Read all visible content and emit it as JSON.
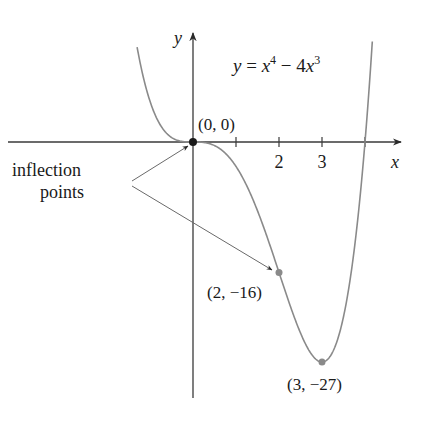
{
  "chart_data": {
    "type": "line",
    "equation": {
      "lhs": "y",
      "eq": " = ",
      "t1": "x",
      "e1": "4",
      "minus": " − 4",
      "t2": "x",
      "e2": "3"
    },
    "xlabel": "x",
    "ylabel": "y",
    "xticks": [
      1,
      2,
      3,
      4
    ],
    "xtick_labels": [
      {
        "x": 2,
        "label": "2"
      },
      {
        "x": 3,
        "label": "3"
      }
    ],
    "xlim": [
      -1.3,
      4.17
    ],
    "ylim": [
      -27,
      12
    ],
    "function": "x^4 - 4x^3",
    "points": [
      {
        "x": 0,
        "y": 0,
        "label": "(0, 0)",
        "kind": "inflection"
      },
      {
        "x": 2,
        "y": -16,
        "label": "(2, −16)",
        "kind": "inflection"
      },
      {
        "x": 3,
        "y": -27,
        "label": "(3, −27)",
        "kind": "minimum"
      }
    ],
    "annotation": {
      "line1": "inflection",
      "line2": "points"
    },
    "grid": false,
    "legend": "none"
  },
  "colors": {
    "axis": "#3a3a3a",
    "curve": "#8a8a8a",
    "point": "#8a8a8a",
    "text": "#1a1a1a"
  }
}
